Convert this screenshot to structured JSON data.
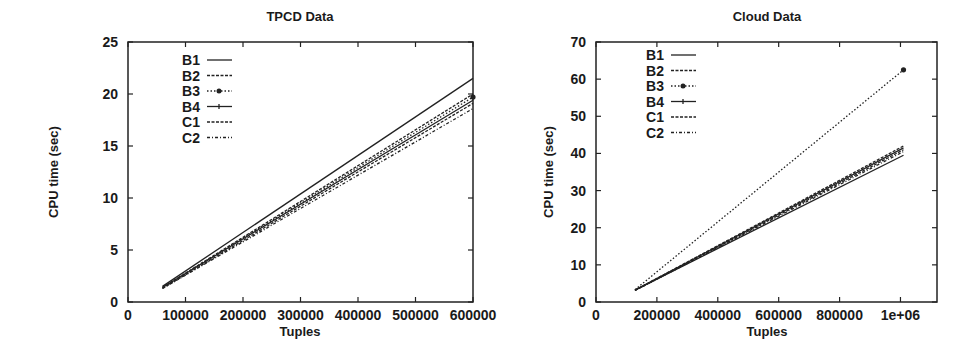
{
  "chart_data": [
    {
      "type": "line",
      "title": "TPCD Data",
      "xlabel": "Tuples",
      "ylabel": "CPU time (sec)",
      "xlim": [
        0,
        600000
      ],
      "ylim": [
        0,
        25
      ],
      "xticks": [
        0,
        100000,
        200000,
        300000,
        400000,
        500000,
        600000
      ],
      "xtick_labels": [
        "0",
        "100000",
        "200000",
        "300000",
        "400000",
        "500000",
        "600000"
      ],
      "yticks": [
        0,
        5,
        10,
        15,
        20,
        25
      ],
      "ytick_labels": [
        "0",
        "5",
        "10",
        "15",
        "20",
        "25"
      ],
      "grid": false,
      "legend_position": "upper-left",
      "x": [
        60000,
        600000
      ],
      "series": [
        {
          "name": "B1",
          "style": "solid",
          "values": [
            1.5,
            21.5
          ]
        },
        {
          "name": "B2",
          "style": "dashed",
          "values": [
            1.4,
            20.0
          ]
        },
        {
          "name": "B3",
          "style": "dotted-marker",
          "values": [
            1.4,
            19.7
          ]
        },
        {
          "name": "B4",
          "style": "solid-marker",
          "values": [
            1.4,
            19.4
          ]
        },
        {
          "name": "C1",
          "style": "dashed",
          "values": [
            1.3,
            19.1
          ]
        },
        {
          "name": "C2",
          "style": "dash-dot",
          "values": [
            1.3,
            18.6
          ]
        }
      ]
    },
    {
      "type": "line",
      "title": "Cloud Data",
      "xlabel": "Tuples",
      "ylabel": "CPU time (sec)",
      "xlim": [
        0,
        1120000
      ],
      "ylim": [
        0,
        70
      ],
      "xticks": [
        0,
        200000,
        400000,
        600000,
        800000,
        1000000
      ],
      "xtick_labels": [
        "0",
        "200000",
        "400000",
        "600000",
        "800000",
        "1e+06"
      ],
      "yticks": [
        0,
        10,
        20,
        30,
        40,
        50,
        60,
        70
      ],
      "ytick_labels": [
        "0",
        "10",
        "20",
        "30",
        "40",
        "50",
        "60",
        "70"
      ],
      "grid": false,
      "legend_position": "upper-left",
      "x": [
        128000,
        1010000
      ],
      "series": [
        {
          "name": "B1",
          "style": "solid",
          "values": [
            3.2,
            39.5
          ]
        },
        {
          "name": "B2",
          "style": "dashed",
          "values": [
            3.2,
            42.0
          ]
        },
        {
          "name": "B3",
          "style": "dotted-marker",
          "values": [
            3.3,
            62.5
          ]
        },
        {
          "name": "B4",
          "style": "solid-marker",
          "values": [
            3.2,
            41.5
          ]
        },
        {
          "name": "C1",
          "style": "dashed",
          "values": [
            3.1,
            41.0
          ]
        },
        {
          "name": "C2",
          "style": "dash-dot",
          "values": [
            3.1,
            40.5
          ]
        }
      ]
    }
  ]
}
